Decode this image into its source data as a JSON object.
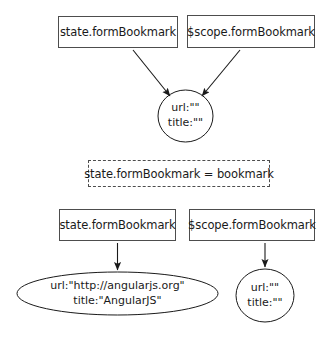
{
  "diagram": {
    "stroke_color": "#4d4d4d",
    "text_color": "#1a1a1a",
    "background_color": "#ffffff",
    "top_section": {
      "boxes": [
        {
          "id": "top-state",
          "label": "state.formBookmark"
        },
        {
          "id": "top-scope",
          "label": "$scope.formBookmark"
        }
      ],
      "target_node": {
        "id": "top-circle",
        "shape": "circle",
        "lines": [
          "url:\"\"",
          "title:\"\""
        ]
      },
      "edges": [
        {
          "from": "top-state",
          "to": "top-circle",
          "style": "solid-arrow"
        },
        {
          "from": "top-scope",
          "to": "top-circle",
          "style": "solid-arrow"
        }
      ]
    },
    "middle_section": {
      "assignment": {
        "id": "assignment",
        "label": "state.formBookmark = bookmark",
        "border_style": "dashed"
      }
    },
    "bottom_section": {
      "boxes": [
        {
          "id": "bot-state",
          "label": "state.formBookmark"
        },
        {
          "id": "bot-scope",
          "label": "$scope.formBookmark"
        }
      ],
      "nodes": [
        {
          "id": "bot-ellipse",
          "shape": "ellipse",
          "lines": [
            "url:\"http://angularjs.org\"",
            "title:\"AngularJS\""
          ]
        },
        {
          "id": "bot-circle",
          "shape": "circle",
          "lines": [
            "url:\"\"",
            "title:\"\""
          ]
        }
      ],
      "edges": [
        {
          "from": "bot-state",
          "to": "bot-ellipse",
          "style": "solid-arrow"
        },
        {
          "from": "bot-scope",
          "to": "bot-circle",
          "style": "solid-arrow"
        }
      ]
    }
  }
}
